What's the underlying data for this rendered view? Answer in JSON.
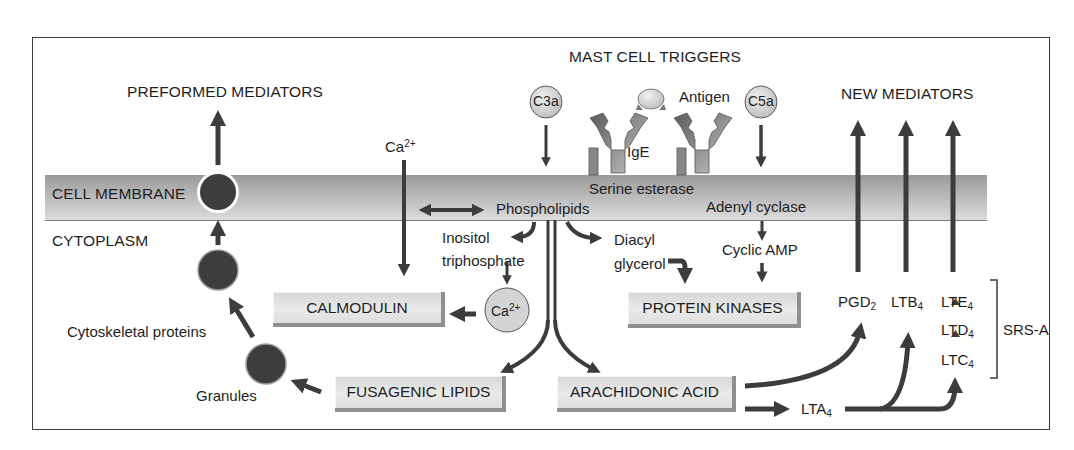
{
  "title": "MAST CELL TRIGGERS",
  "regions": {
    "preformed": "PREFORMED MEDIATORS",
    "new": "NEW MEDIATORS",
    "membrane": "CELL MEMBRANE",
    "cytoplasm": "CYTOPLASM"
  },
  "triggers": {
    "c3a": "C3a",
    "c5a": "C5a",
    "ige": "IgE",
    "antigen": "Antigen",
    "calcium_in": "Ca",
    "calcium_charge": "2+"
  },
  "membrane_labels": {
    "serine_esterase": "Serine esterase",
    "phospholipids": "Phospholipids",
    "adenyl_cyclase": "Adenyl cyclase"
  },
  "cytoplasm_labels": {
    "inositol_1": "Inositol",
    "inositol_2": "triphosphate",
    "diacyl_1": "Diacyl",
    "diacyl_2": "glycerol",
    "cyclic_amp": "Cyclic AMP",
    "ca_ion": "Ca",
    "ca_ion_charge": "2+",
    "cytoskeletal": "Cytoskeletal proteins",
    "granules": "Granules"
  },
  "boxes": {
    "calmodulin": "CALMODULIN",
    "protein_kinases": "PROTEIN KINASES",
    "fusagenic": "FUSAGENIC LIPIDS",
    "arachidonic": "ARACHIDONIC ACID"
  },
  "mediators": {
    "pgd2": {
      "base": "PGD",
      "sub": "2"
    },
    "ltb4": {
      "base": "LTB",
      "sub": "4"
    },
    "lte4": {
      "base": "LTE",
      "sub": "4"
    },
    "ltd4": {
      "base": "LTD",
      "sub": "4"
    },
    "ltc4": {
      "base": "LTC",
      "sub": "4"
    },
    "lta4": {
      "base": "LTA",
      "sub": "4"
    },
    "srsa": "SRS-A"
  },
  "colors": {
    "arrow": "#3c3c3c",
    "granule": "#3d3d3d",
    "membrane_dark": "#9a9a9a",
    "membrane_light": "#dcdcdc",
    "box_fill": "#e2e2e2",
    "box_shadow": "#8f8f8f",
    "circle_fill": "#d4d4d4"
  }
}
